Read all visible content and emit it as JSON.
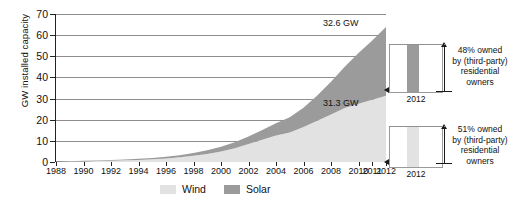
{
  "chart_data": {
    "type": "area",
    "title": "",
    "subtitle": "",
    "xlabel": "",
    "ylabel": "GW installed capacity",
    "ylim": [
      0,
      70
    ],
    "ytick_step": 10,
    "yticks": [
      "0",
      "10",
      "20",
      "30",
      "40",
      "50",
      "60",
      "70"
    ],
    "grid": true,
    "stacked": true,
    "legend_position": "bottom",
    "x": [
      1988,
      1989,
      1990,
      1991,
      1992,
      1993,
      1994,
      1995,
      1996,
      1997,
      1998,
      1999,
      2000,
      2001,
      2002,
      2003,
      2004,
      2005,
      2006,
      2007,
      2008,
      2009,
      2010,
      2011,
      2012
    ],
    "xtick_labels": [
      "1988",
      "1990",
      "1992",
      "1994",
      "1996",
      "1998",
      "2000",
      "2002",
      "2004",
      "2006",
      "2008",
      "2010",
      "2011",
      "2012"
    ],
    "xtick_values": [
      1988,
      1990,
      1992,
      1994,
      1996,
      1998,
      2000,
      2002,
      2004,
      2006,
      2008,
      2010,
      2011,
      2012
    ],
    "series": [
      {
        "name": "Wind",
        "color": "#e2e2e2",
        "values": [
          0.2,
          0.3,
          0.4,
          0.5,
          0.6,
          0.8,
          1.0,
          1.3,
          1.7,
          2.2,
          2.9,
          3.8,
          5.0,
          6.5,
          8.5,
          10.5,
          12.5,
          14.0,
          16.5,
          19.5,
          22.5,
          25.5,
          27.5,
          29.5,
          31.3
        ]
      },
      {
        "name": "Solar",
        "color": "#9b9b9b",
        "values": [
          0.1,
          0.1,
          0.2,
          0.2,
          0.3,
          0.4,
          0.5,
          0.6,
          0.8,
          1.0,
          1.3,
          1.7,
          2.2,
          2.8,
          3.6,
          4.6,
          5.8,
          7.2,
          9.2,
          12.0,
          15.5,
          19.5,
          24.0,
          28.0,
          32.6
        ]
      }
    ],
    "annotations": [
      {
        "name": "solar-value",
        "text": "32.6 GW",
        "series": "Solar",
        "year": 2012,
        "value": 32.6
      },
      {
        "name": "wind-value",
        "text": "31.3 GW",
        "series": "Wind",
        "year": 2012,
        "value": 31.3
      }
    ],
    "insets": [
      {
        "name": "solar-ownership",
        "year_label": "2012",
        "bar_color": "#9b9b9b",
        "share_percent": 48,
        "annotation_lines": [
          "48% owned",
          "by (third-party)",
          "residential",
          "owners"
        ]
      },
      {
        "name": "wind-ownership",
        "year_label": "2012",
        "bar_color": "#e2e2e2",
        "share_percent": 51,
        "annotation_lines": [
          "51% owned",
          "by (third-party)",
          "residential",
          "owners"
        ]
      }
    ],
    "legend": [
      {
        "label": "Wind",
        "color": "#e2e2e2"
      },
      {
        "label": "Solar",
        "color": "#9b9b9b"
      }
    ]
  }
}
